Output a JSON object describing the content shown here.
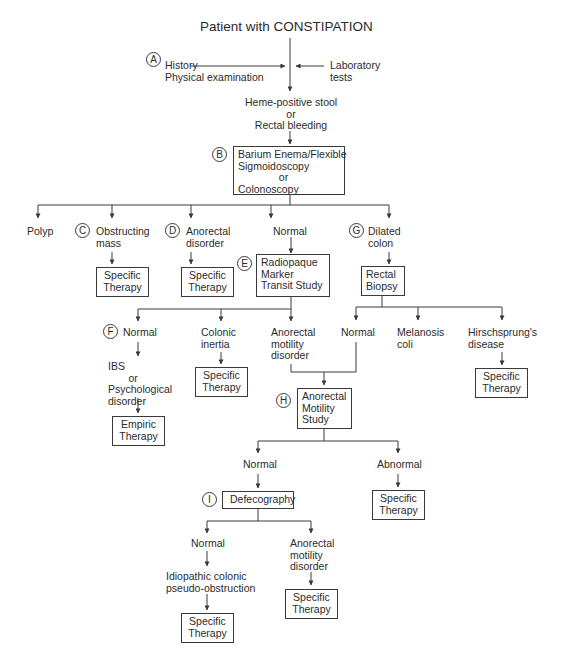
{
  "title": "Patient with CONSTIPATION",
  "inputs": {
    "left": "History\nPhysical examination",
    "right": "Laboratory\ntests"
  },
  "heme": "Heme-positive stool\nor\nRectal bleeding",
  "steps": {
    "A": "A",
    "B": "B",
    "C": "C",
    "D": "D",
    "E": "E",
    "F": "F",
    "G": "G",
    "H": "H",
    "I": "I"
  },
  "boxes": {
    "barium": "Barium Enema/Flexible\nSigmoidoscopy\n              or\nColonoscopy",
    "radiopaque": "Radiopaque\nMarker\nTransit Study",
    "rectal_biopsy": "Rectal\nBiopsy",
    "anorectal_motility_study": "Anorectal\nMotility\nStudy",
    "defecography": "Defecography",
    "specific_therapy_obstructing": "Specific\nTherapy",
    "specific_therapy_anorectal_disorder": "Specific\nTherapy",
    "specific_therapy_colonic_inertia": "Specific\nTherapy",
    "specific_therapy_hirschsprung": "Specific\nTherapy",
    "empiric_therapy": "Empiric\nTherapy",
    "specific_therapy_abnormal": "Specific\nTherapy",
    "specific_therapy_idiopathic": "Specific\nTherapy",
    "specific_therapy_anorectal_motility_2": "Specific\nTherapy"
  },
  "level1": {
    "polyp": "Polyp",
    "obstructing": "Obstructing\nmass",
    "anorectal_disorder": "Anorectal\ndisorder",
    "normal": "Normal",
    "dilated": "Dilated\ncolon"
  },
  "level2": {
    "normal": "Normal",
    "ibs": "IBS\n       or\nPsychological\ndisorder",
    "colonic_inertia": "Colonic\ninertia",
    "anorectal_motility": "Anorectal\nmotility\ndisorder",
    "biopsy_normal": "Normal",
    "melanosis": "Melanosis\ncoli",
    "hirschsprung": "Hirschsprung's\ndisease"
  },
  "level3": {
    "normal": "Normal",
    "abnormal": "Abnormal"
  },
  "level4": {
    "normal": "Normal",
    "idiopathic": "Idiopathic colonic\npseudo-obstruction",
    "anorectal_motility": "Anorectal\nmotility\ndisorder"
  },
  "colors": {
    "line": "#3a3a3a",
    "text": "#2b2b2b",
    "background": "#ffffff"
  }
}
